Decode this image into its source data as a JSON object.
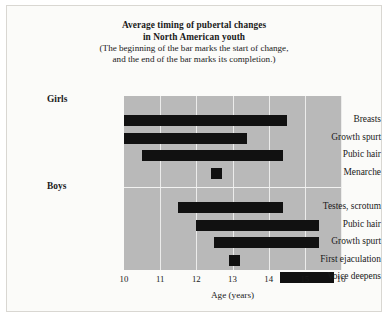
{
  "title": {
    "line1": "Average timing of pubertal changes",
    "line2": "in North American youth",
    "sub1": "(The beginning of the bar marks the start of change,",
    "sub2": "and the end of the bar marks its completion.)"
  },
  "axis": {
    "xlabel": "Age (years)",
    "ticks": [
      "10",
      "11",
      "12",
      "13",
      "14",
      "15",
      "16"
    ]
  },
  "groups": {
    "girls": "Girls",
    "boys": "Boys"
  },
  "colors": {
    "plot_background": "#b9b9b9",
    "bar": "#111111",
    "gridline": "#ececeb",
    "page": "#fbfbf9"
  },
  "chart_data": {
    "type": "bar",
    "orientation": "horizontal-range",
    "title": "Average timing of pubertal changes in North American youth",
    "subtitle": "(The beginning of the bar marks the start of change, and the end of the bar marks its completion.)",
    "xlabel": "Age (years)",
    "ylabel": "",
    "xlim": [
      10,
      16
    ],
    "xticks": [
      10,
      11,
      12,
      13,
      14,
      15,
      16
    ],
    "grid": true,
    "legend": "none",
    "categories": [
      "Breasts",
      "Growth spurt",
      "Pubic hair",
      "Menarche",
      "Testes, scrotum",
      "Pubic hair",
      "Growth spurt",
      "First ejaculation",
      "Voice deepens"
    ],
    "series": [
      {
        "name": "Girls",
        "items": [
          {
            "label": "Breasts",
            "start": 10.0,
            "end": 14.5
          },
          {
            "label": "Growth spurt",
            "start": 10.0,
            "end": 13.4
          },
          {
            "label": "Pubic hair",
            "start": 10.5,
            "end": 14.4
          },
          {
            "label": "Menarche",
            "start": 12.4,
            "end": 12.7
          }
        ]
      },
      {
        "name": "Boys",
        "items": [
          {
            "label": "Testes, scrotum",
            "start": 11.5,
            "end": 14.4
          },
          {
            "label": "Pubic hair",
            "start": 12.0,
            "end": 15.4
          },
          {
            "label": "Growth spurt",
            "start": 12.5,
            "end": 15.4
          },
          {
            "label": "First ejaculation",
            "start": 12.9,
            "end": 13.2
          },
          {
            "label": "Voice deepens",
            "start": 14.3,
            "end": 15.8
          }
        ]
      }
    ]
  }
}
